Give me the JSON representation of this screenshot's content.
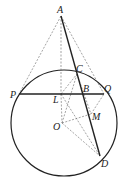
{
  "diagram": {
    "type": "geometry",
    "points": {
      "A": {
        "label": "A",
        "x": 61,
        "y": 16
      },
      "P": {
        "label": "P",
        "x": 19,
        "y": 94
      },
      "Q": {
        "label": "Q",
        "x": 104,
        "y": 94
      },
      "B": {
        "label": "B",
        "x": 82,
        "y": 94
      },
      "C": {
        "label": "C",
        "x": 77,
        "y": 74
      },
      "L": {
        "label": "L",
        "x": 61,
        "y": 94
      },
      "O": {
        "label": "O",
        "x": 62,
        "y": 123
      },
      "M": {
        "label": "M",
        "x": 91,
        "y": 114
      },
      "D": {
        "label": "D",
        "x": 100,
        "y": 156
      }
    },
    "circle": {
      "center": "O",
      "cx": 64,
      "cy": 123,
      "r": 53
    },
    "solid_segments": [
      "PQ",
      "AD"
    ],
    "dashed_segments": [
      "AP",
      "AQ",
      "AL",
      "LC",
      "LD",
      "OC",
      "OQ",
      "OM",
      "OD",
      "LO"
    ]
  }
}
